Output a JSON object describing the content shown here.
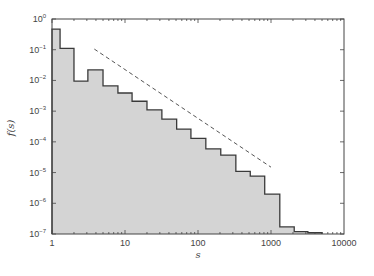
{
  "chart_data": {
    "type": "bar",
    "subtype": "log-log step histogram",
    "title": "",
    "xlabel": "s",
    "ylabel": "f(s)",
    "xscale": "log",
    "yscale": "log",
    "xlim": [
      1,
      10000
    ],
    "ylim": [
      1e-07,
      1
    ],
    "grid": false,
    "legend": null,
    "x_tick_labels": [
      "1",
      "10",
      "100",
      "1000",
      "10000"
    ],
    "y_tick_labels": [
      {
        "base": "10",
        "exp": "0"
      },
      {
        "base": "10",
        "exp": "−1"
      },
      {
        "base": "10",
        "exp": "−2"
      },
      {
        "base": "10",
        "exp": "−3"
      },
      {
        "base": "10",
        "exp": "−4"
      },
      {
        "base": "10",
        "exp": "−5"
      },
      {
        "base": "10",
        "exp": "−6"
      },
      {
        "base": "10",
        "exp": "−7"
      }
    ],
    "bin_edges": [
      1,
      1.29,
      2,
      3.1,
      5,
      8,
      12.5,
      20,
      32,
      51,
      80,
      128,
      205,
      330,
      520,
      820,
      1320,
      2080,
      3200,
      5000
    ],
    "values": [
      0.47,
      0.11,
      0.0095,
      0.022,
      0.0066,
      0.0039,
      0.0021,
      0.0011,
      0.00055,
      0.00026,
      0.00013,
      5.9e-05,
      3.7e-05,
      1.1e-05,
      7.7e-06,
      2e-06,
      1.7e-07,
      1.2e-07,
      1.1e-07
    ],
    "reference_line": {
      "style": "dashed",
      "x": [
        3.8,
        1000
      ],
      "y": [
        0.105,
        1.5e-05
      ]
    },
    "colors": {
      "fill": "#d4d4d4",
      "outline": "#3a3a3a",
      "reference_line": "#555555",
      "axes": "#444444"
    }
  }
}
